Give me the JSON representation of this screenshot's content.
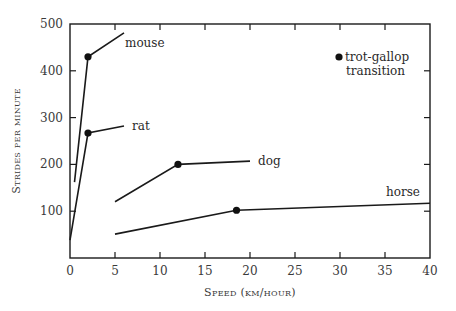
{
  "chart_data": {
    "type": "line",
    "title": "",
    "xlabel": "Speed (km/hour)",
    "ylabel": "Strides per minute",
    "xlim": [
      0,
      40
    ],
    "ylim": [
      0,
      500
    ],
    "xticks": [
      0,
      5,
      10,
      15,
      20,
      25,
      30,
      35,
      40
    ],
    "yticks": [
      100,
      200,
      300,
      400,
      500
    ],
    "grid": false,
    "legend": {
      "position": "top-right",
      "entries": [
        {
          "marker": "filled-circle",
          "label_line1": "trot-gallop",
          "label_line2": "transition"
        }
      ]
    },
    "series": [
      {
        "name": "mouse",
        "points": [
          [
            0.5,
            162
          ],
          [
            2,
            430
          ],
          [
            6,
            481
          ]
        ],
        "transition": [
          2,
          430
        ]
      },
      {
        "name": "rat",
        "points": [
          [
            0,
            38
          ],
          [
            2,
            267
          ],
          [
            6,
            282
          ]
        ],
        "transition": [
          2,
          267
        ]
      },
      {
        "name": "dog",
        "points": [
          [
            5,
            120
          ],
          [
            12,
            200
          ],
          [
            20,
            207
          ]
        ],
        "transition": [
          12,
          200
        ]
      },
      {
        "name": "horse",
        "points": [
          [
            5,
            51
          ],
          [
            18.5,
            102
          ],
          [
            40,
            117
          ]
        ],
        "transition": [
          18.5,
          102
        ]
      }
    ],
    "labels": {
      "mouse": "mouse",
      "rat": "rat",
      "dog": "dog",
      "horse": "horse"
    }
  },
  "axis": {
    "x_title": "Speed (km/hour)",
    "y_title": "Strides per minute"
  }
}
